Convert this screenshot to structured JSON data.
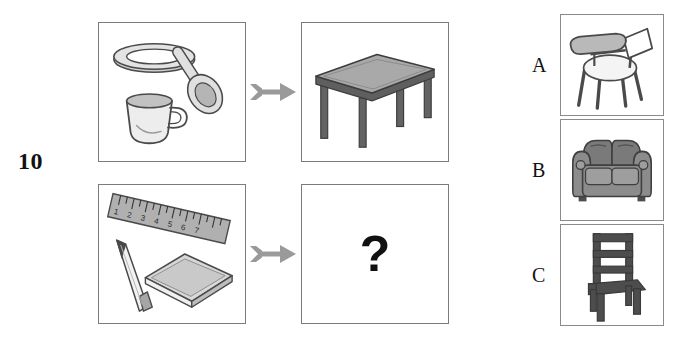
{
  "item": {
    "number": "10",
    "type": "picture-analogy",
    "question_mark": "?"
  },
  "matrix": {
    "rows": [
      {
        "id": "row-1",
        "source": {
          "name": "tableware-set",
          "objects": [
            "plate",
            "spoon",
            "cup"
          ]
        },
        "arrow": "arrow-right",
        "target": {
          "name": "table",
          "objects": [
            "table"
          ]
        }
      },
      {
        "id": "row-2",
        "source": {
          "name": "stationery-set",
          "objects": [
            "ruler",
            "pencil",
            "notebook"
          ],
          "ruler_ticks": [
            "1",
            "2",
            "3",
            "4",
            "5",
            "6",
            "7"
          ]
        },
        "arrow": "arrow-right",
        "target": {
          "name": "unknown",
          "objects": []
        }
      }
    ]
  },
  "options": [
    {
      "label": "A",
      "name": "tablet-arm-desk-chair"
    },
    {
      "label": "B",
      "name": "sofa"
    },
    {
      "label": "C",
      "name": "wooden-chair"
    }
  ],
  "colors": {
    "panel_border": "#7b7b7b",
    "option_border": "#8a8a8a",
    "arrow": "#9a9a9a",
    "ink": "#4a4a4a",
    "fill_light": "#e8e8e8",
    "fill_mid": "#b8b8b8",
    "fill_dark": "#6e6e6e",
    "fill_darkest": "#4d4d4d",
    "text": "#111111",
    "background": "#ffffff"
  }
}
